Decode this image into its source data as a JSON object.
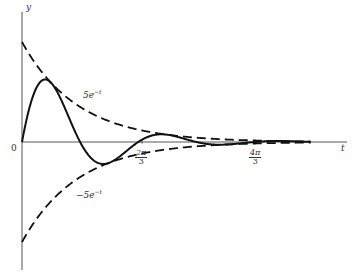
{
  "chart_data": {
    "type": "line",
    "title": "",
    "xlabel": "t",
    "ylabel": "y",
    "origin_label": "0",
    "x_tick_labels": [
      {
        "num": "2π",
        "den": "3",
        "value": 2.0944
      },
      {
        "num": "4π",
        "den": "3",
        "value": 4.1888
      }
    ],
    "xlim": [
      0,
      5.4
    ],
    "ylim": [
      -5.2,
      5.8
    ],
    "grid": false,
    "legend": "none",
    "series": [
      {
        "name": "5e^{-t} sin 3t",
        "style": "solid",
        "expression": "5*exp(-t)*sin(3*t)"
      },
      {
        "name": "5e^{-t}",
        "style": "dashed",
        "expression": "5*exp(-t)",
        "annotation": "5e^{-t}"
      },
      {
        "name": "-5e^{-t}",
        "style": "dashed",
        "expression": "-5*exp(-t)",
        "annotation": "−5e^{-t}"
      }
    ],
    "sample_points": {
      "t": [
        0,
        0.5,
        1.0472,
        1.5,
        2.0944,
        2.6,
        3.1416,
        3.7,
        4.1888,
        5.0
      ],
      "solid": [
        0,
        3.03,
        0,
        -1.09,
        0,
        0.37,
        0,
        -0.11,
        0,
        0.02
      ],
      "upper": [
        5,
        3.03,
        1.75,
        1.12,
        0.62,
        0.37,
        0.22,
        0.12,
        0.08,
        0.03
      ],
      "lower": [
        -5,
        -3.03,
        -1.75,
        -1.12,
        -0.62,
        -0.37,
        -0.22,
        -0.12,
        -0.08,
        -0.03
      ]
    }
  },
  "labels": {
    "y_axis": "y",
    "t_axis": "t",
    "origin": "0",
    "upper_envelope": "5e",
    "upper_exp": "−t",
    "lower_envelope": "−5e",
    "lower_exp": "−t",
    "tick1_num": "2π",
    "tick1_den": "3",
    "tick2_num": "4π",
    "tick2_den": "3"
  }
}
